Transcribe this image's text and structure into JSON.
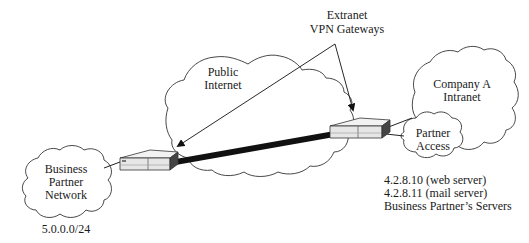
{
  "diagram": {
    "callout": {
      "line1": "Extranet",
      "line2": "VPN Gateways"
    },
    "clouds": {
      "public_internet": {
        "line1": "Public",
        "line2": "Internet"
      },
      "business_partner": {
        "line1": "Business",
        "line2": "Partner",
        "line3": "Network"
      },
      "company_intranet": {
        "line1": "Company A",
        "line2": "Intranet"
      },
      "partner_access": {
        "line1": "Partner",
        "line2": "Access"
      }
    },
    "labels": {
      "partner_subnet": "5.0.0.0/24",
      "server_web": "4.2.8.10 (web server)",
      "server_mail": "4.2.8.11 (mail server)",
      "servers_caption": "Business Partner’s Servers"
    },
    "icons": {
      "left_gateway": "vpn-gateway-device",
      "right_gateway": "vpn-gateway-device",
      "tunnel": "vpn-tunnel-link"
    }
  }
}
